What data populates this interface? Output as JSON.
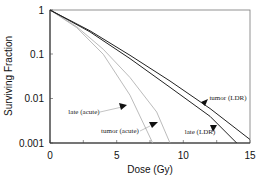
{
  "chart_data": {
    "type": "line",
    "title": "",
    "xlabel": "Dose (Gy)",
    "ylabel": "Surviving Fraction",
    "xlim": [
      0,
      15
    ],
    "ylim": [
      0.001,
      1
    ],
    "yscale": "log",
    "grid": false,
    "legend": "inline annotations with arrows",
    "x_ticks": [
      "0",
      "5",
      "10",
      "15"
    ],
    "y_ticks": [
      "1",
      "0.1",
      "0.01",
      "0.001"
    ],
    "series": [
      {
        "name": "late (acute)",
        "color": "#aaaaaa",
        "x": [
          0,
          2,
          4,
          6,
          7.7
        ],
        "y": [
          1,
          0.4,
          0.1,
          0.012,
          0.001
        ]
      },
      {
        "name": "tumor (acute)",
        "color": "#aaaaaa",
        "x": [
          0,
          2,
          4,
          6,
          8,
          9.0
        ],
        "y": [
          1,
          0.42,
          0.13,
          0.03,
          0.005,
          0.001
        ]
      },
      {
        "name": "late (LDR)",
        "color": "#222222",
        "x": [
          0,
          3,
          6,
          9,
          12,
          14.0
        ],
        "y": [
          1,
          0.32,
          0.08,
          0.018,
          0.004,
          0.001
        ]
      },
      {
        "name": "tumor (LDR)",
        "color": "#222222",
        "x": [
          0,
          3,
          6,
          9,
          12,
          15
        ],
        "y": [
          1,
          0.34,
          0.095,
          0.025,
          0.006,
          0.0012
        ]
      }
    ],
    "annotations": [
      {
        "text": "late (acute)",
        "arrow_to_series": "late (acute)"
      },
      {
        "text": "tumor (acute)",
        "arrow_to_series": "tumor (acute)"
      },
      {
        "text": "late (LDR)",
        "arrow_to_series": "late (LDR)"
      },
      {
        "text": "tumor (LDR)",
        "arrow_to_series": "tumor (LDR)"
      }
    ]
  }
}
